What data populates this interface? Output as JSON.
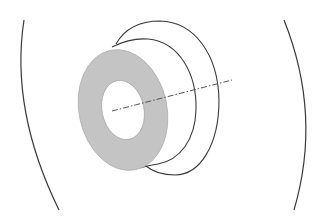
{
  "diagram": {
    "type": "3d-ring-schematic",
    "colors": {
      "background": "#ffffff",
      "ring_fill": "#c4c4c4",
      "ring_hole_fill": "#ffffff",
      "stroke": "#3a3a3a",
      "axis": "#555555"
    },
    "elements": {
      "left_arc": {
        "label": "left-boundary-arc"
      },
      "right_arc": {
        "label": "right-boundary-arc"
      },
      "ring": {
        "label": "annular-ring"
      },
      "ring_hole": {
        "label": "ring-inner-hole"
      },
      "inner_surface": {
        "label": "inner-cylinder-outline"
      },
      "outer_surface": {
        "label": "outer-cylinder-outline"
      },
      "axis": {
        "label": "central-axis",
        "style": "dash-dot"
      }
    }
  }
}
